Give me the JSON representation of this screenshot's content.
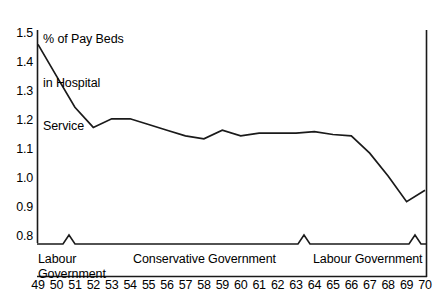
{
  "chart_data": {
    "type": "line",
    "title": "% of Pay Beds in Hospital Service",
    "title_lines": [
      "% of Pay Beds",
      "in Hospital",
      "Service"
    ],
    "xlabel": "",
    "ylabel": "% of Pay Beds in Hospital Service",
    "xlim": [
      49,
      70
    ],
    "ylim": [
      0.8,
      1.5
    ],
    "grid": false,
    "legend": "none",
    "x": [
      49,
      50,
      51,
      52,
      53,
      54,
      55,
      56,
      57,
      58,
      59,
      60,
      61,
      62,
      63,
      64,
      65,
      66,
      67,
      68,
      69,
      70
    ],
    "categories": [
      "49",
      "50",
      "51",
      "52",
      "53",
      "54",
      "55",
      "56",
      "57",
      "58",
      "59",
      "60",
      "61",
      "62",
      "63",
      "64",
      "65",
      "66",
      "67",
      "68",
      "69",
      "70"
    ],
    "values": [
      1.46,
      1.35,
      1.24,
      1.17,
      1.2,
      1.2,
      1.18,
      1.16,
      1.14,
      1.13,
      1.16,
      1.14,
      1.15,
      1.15,
      1.15,
      1.155,
      1.145,
      1.14,
      1.08,
      1.0,
      0.91,
      0.95
    ],
    "ytick_labels": [
      "1.5",
      "1.4",
      "1.3",
      "1.2",
      "1.1",
      "1.0",
      "0.9",
      "0.8"
    ],
    "ytick_values": [
      1.5,
      1.4,
      1.3,
      1.2,
      1.1,
      1.0,
      0.9,
      0.8
    ],
    "xtick_labels": [
      "49",
      "50",
      "51",
      "52",
      "53",
      "54",
      "55",
      "56",
      "57",
      "58",
      "59",
      "60",
      "61",
      "62",
      "63",
      "64",
      "65",
      "66",
      "67",
      "68",
      "69",
      "70"
    ],
    "annotations": [
      {
        "label": "Labour Government",
        "lines": [
          "Labour",
          "Government"
        ],
        "from": 49,
        "to": 51
      },
      {
        "label": "Conservative Government",
        "lines": [
          "Conservative Government"
        ],
        "from": 52,
        "to": 64
      },
      {
        "label": "Labour Government",
        "lines": [
          "Labour Government"
        ],
        "from": 65,
        "to": 70
      }
    ],
    "band_markers": [
      51.5,
      64.2,
      69.2
    ],
    "line_color": "#1a1a1a",
    "axis_color": "#1a1a1a",
    "background_color": "#ffffff"
  },
  "title": {
    "line1": "% of Pay Beds",
    "line2": "in Hospital",
    "line3": "Service"
  },
  "yaxis": {
    "t0": "1.5",
    "t1": "1.4",
    "t2": "1.3",
    "t3": "1.2",
    "t4": "1.1",
    "t5": "1.0",
    "t6": "0.9",
    "t7": "0.8"
  },
  "xaxis": {
    "ticks": [
      "49",
      "50",
      "51",
      "52",
      "53",
      "54",
      "55",
      "56",
      "57",
      "58",
      "59",
      "60",
      "61",
      "62",
      "63",
      "64",
      "65",
      "66",
      "67",
      "68",
      "69",
      "70"
    ]
  },
  "bands": {
    "labour1_line1": "Labour",
    "labour1_line2": "Government",
    "conservative": "Conservative Government",
    "labour2": "Labour Government"
  }
}
